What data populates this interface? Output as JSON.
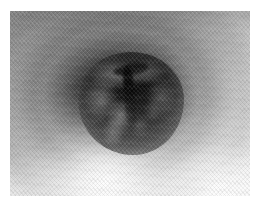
{
  "page": {
    "width": 263,
    "height": 208,
    "background_color": "#ffffff"
  },
  "photo": {
    "name": "endoscopic-lumen-image",
    "description": "Monochrome endoscopic view down a tubular lumen with concentric luminance rings and a dark convoluted central mass bearing a vertical cleft",
    "caption": "",
    "modality": "grayscale photograph",
    "frame": {
      "left": 10,
      "top": 11,
      "width": 240,
      "height": 185,
      "border_color": "#ffffff"
    },
    "tone": {
      "darkest": "#050505",
      "mass_core": "#0d0d0d",
      "mid_wall": "#8c8c8c",
      "outer_wall": "#b4b4b4",
      "brightest": "#fbfbfb"
    },
    "regions": [
      {
        "name": "central-mass",
        "label": "Dark textured central mass",
        "center_x_pct": 50,
        "center_y_pct": 50,
        "width_pct": 44,
        "height_pct": 56,
        "mean_tone": "#171717"
      },
      {
        "name": "central-cleft",
        "label": "Vertical dark fissure",
        "center_x_pct": 48,
        "center_y_pct": 44,
        "mean_tone": "#050505"
      },
      {
        "name": "inner-ring",
        "label": "Inner lumen wall ring",
        "mean_tone": "#5c5c5c"
      },
      {
        "name": "mid-ring",
        "label": "Mid lumen wall ring",
        "mean_tone": "#9c9c9c"
      },
      {
        "name": "outer-bright-arc",
        "label": "Outer bright arc band",
        "mean_tone": "#cfcfcf"
      },
      {
        "name": "lower-left-highlight",
        "label": "Bright lower-left falloff",
        "mean_tone": "#f2f2f2"
      },
      {
        "name": "lower-right-highlight",
        "label": "Bright lower-right falloff",
        "mean_tone": "#ededed"
      },
      {
        "name": "upper-left-shadow",
        "label": "Darker upper-left corner",
        "mean_tone": "#6f6f6f"
      }
    ],
    "texture": {
      "name": "diagonal-interlace-crosshatch",
      "label": "Fine diagonal crosshatch interlace pattern",
      "primary_angle_deg": 48,
      "secondary_angle_deg": -46
    }
  }
}
